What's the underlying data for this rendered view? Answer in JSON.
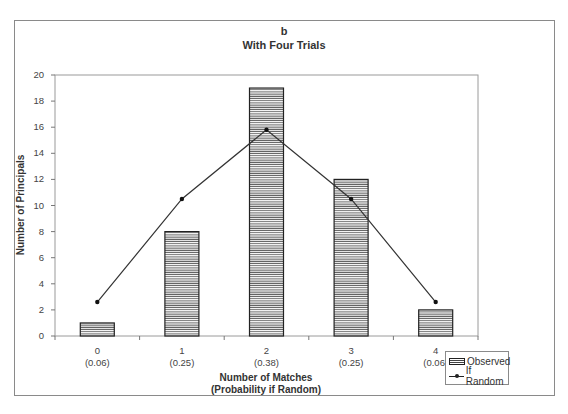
{
  "chart_data": {
    "type": "bar",
    "panel_label": "b",
    "title": "With Four Trials",
    "xlabel": "Number of Matches",
    "xlabel_sub": "(Probability if Random)",
    "ylabel": "Number of Principals",
    "ylim": [
      0,
      20
    ],
    "yticks": [
      0,
      2,
      4,
      6,
      8,
      10,
      12,
      14,
      16,
      18,
      20
    ],
    "categories": [
      "0",
      "1",
      "2",
      "3",
      "4"
    ],
    "category_probabilities": [
      "(0.06)",
      "(0.25)",
      "(0.38)",
      "(0.25)",
      "(0.06)"
    ],
    "series": [
      {
        "name": "Observed",
        "type": "bar",
        "pattern": "horizontal-stripes",
        "values": [
          1,
          8,
          19,
          12,
          2
        ]
      },
      {
        "name": "If Random",
        "type": "line",
        "marker": "diamond",
        "values": [
          2.6,
          10.5,
          15.8,
          10.5,
          2.6
        ]
      }
    ],
    "grid": false,
    "legend_position": "bottom-right"
  },
  "legend": {
    "observed": "Observed",
    "random": "If Random"
  }
}
